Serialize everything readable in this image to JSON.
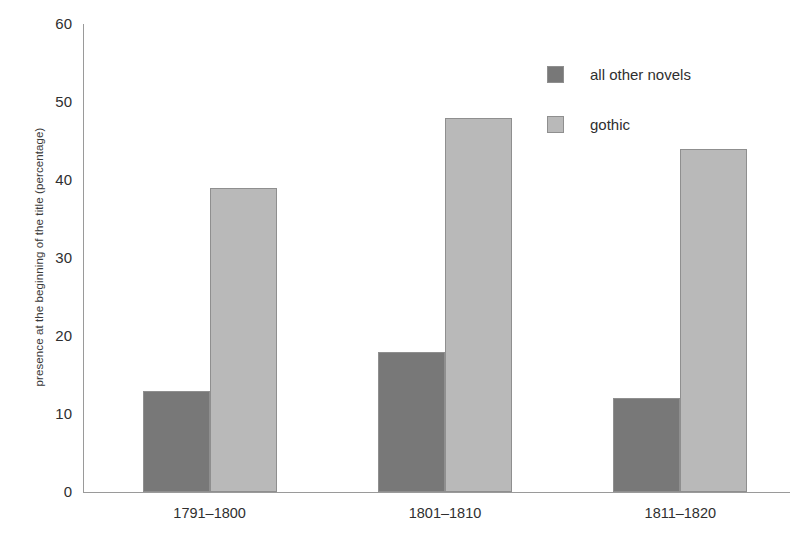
{
  "chart_data": {
    "type": "bar",
    "title": "",
    "xlabel": "",
    "ylabel": "presence at the beginning of the title (percentage)",
    "categories": [
      "1791–1800",
      "1801–1810",
      "1811–1820"
    ],
    "series": [
      {
        "name": "all other novels",
        "color": "#787878",
        "values": [
          13,
          18,
          12
        ]
      },
      {
        "name": "gothic",
        "color": "#b9b9b9",
        "values": [
          39,
          48,
          44
        ]
      }
    ],
    "ylim": [
      0,
      60
    ],
    "yticks": [
      0,
      10,
      20,
      30,
      40,
      50,
      60
    ],
    "ytick_labels": [
      "0",
      "10",
      "20",
      "30",
      "40",
      "50",
      "60"
    ],
    "grid": false,
    "legend_position": "top-right",
    "legend_entries": [
      "all other novels",
      "gothic"
    ]
  }
}
